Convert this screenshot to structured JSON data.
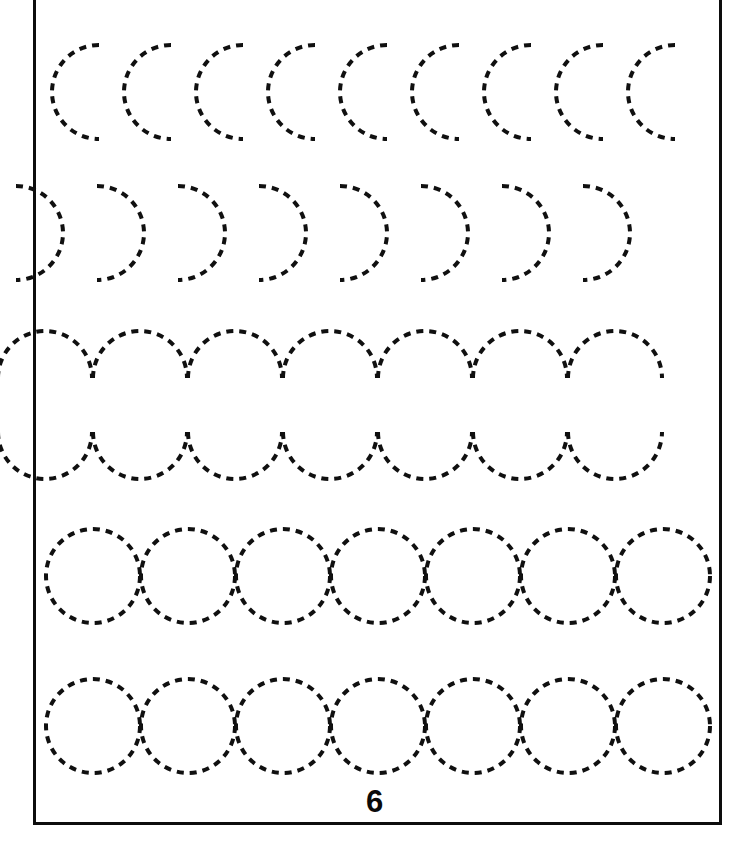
{
  "worksheet": {
    "title": "Curve and Circle Tracing Practice",
    "page_number": "6",
    "page_width": 749,
    "page_height": 845,
    "background_color": "#ffffff",
    "stroke_color": "#101010",
    "frame": {
      "color": "#0d0d0d",
      "thickness": 3,
      "left": 33,
      "top": -14,
      "width": 689,
      "height": 839
    },
    "dash_style": {
      "dash_length": 7,
      "gap_length": 6,
      "stroke_width": 4,
      "linecap": "butt"
    },
    "rows": [
      {
        "id": "row-1-left-arcs",
        "label": "Row 1: left half-circle arcs opening right",
        "shape": "arc-left-half",
        "count": 9,
        "start_x": 52,
        "spacing": 72,
        "center_y": 92,
        "radius": 47,
        "stroke_width": 4,
        "dash": "7 6"
      },
      {
        "id": "row-2-right-arcs",
        "label": "Row 2: right half-circle arcs opening left",
        "shape": "arc-right-half",
        "count": 8,
        "start_x": 63,
        "spacing": 81,
        "center_y": 233,
        "radius": 47,
        "stroke_width": 4,
        "dash": "7 6"
      },
      {
        "id": "row-3-upper-arches",
        "label": "Row 3: upper half-circle arches",
        "shape": "arc-top-half",
        "count": 7,
        "start_x": 45,
        "spacing": 95,
        "baseline_y": 378,
        "radius": 47,
        "stroke_width": 4,
        "dash": "7 6"
      },
      {
        "id": "row-4-lower-valleys",
        "label": "Row 4: lower half-circle valleys",
        "shape": "arc-bottom-half",
        "count": 7,
        "start_x": 45,
        "spacing": 95,
        "baseline_y": 432,
        "radius": 47,
        "stroke_width": 4,
        "dash": "7 6"
      },
      {
        "id": "row-5-circles",
        "label": "Row 5: full circles touching",
        "shape": "circle",
        "count": 7,
        "start_x": 93,
        "spacing": 95,
        "center_y": 576,
        "radius": 47,
        "stroke_width": 4,
        "dash": "7 6"
      },
      {
        "id": "row-6-circles",
        "label": "Row 6: full circles touching",
        "shape": "circle",
        "count": 7,
        "start_x": 93,
        "spacing": 95,
        "center_y": 726,
        "radius": 47,
        "stroke_width": 4,
        "dash": "7 6"
      }
    ]
  }
}
